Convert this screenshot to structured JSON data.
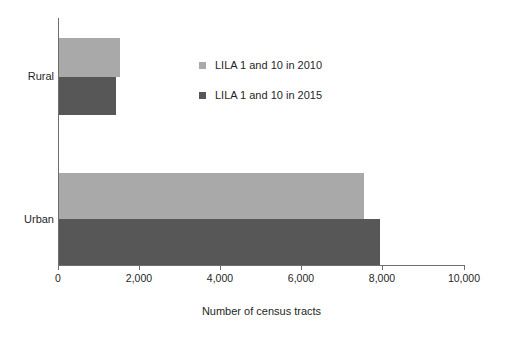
{
  "chart_data": {
    "type": "bar",
    "orientation": "horizontal",
    "title": "",
    "xlabel": "Number of census tracts",
    "ylabel": "",
    "categories": [
      "Rural",
      "Urban"
    ],
    "series": [
      {
        "name": "LILA 1 and 10 in 2010",
        "color": "#a9a9a9",
        "values": [
          1500,
          7500
        ]
      },
      {
        "name": "LILA 1 and 10 in 2015",
        "color": "#575757",
        "values": [
          1400,
          7900
        ]
      }
    ],
    "xlim": [
      0,
      10000
    ],
    "xticks": [
      0,
      2000,
      4000,
      6000,
      8000,
      10000
    ],
    "xtick_labels": [
      "0",
      "2,000",
      "4,000",
      "6,000",
      "8,000",
      "10,000"
    ],
    "grid": false,
    "legend_position": "inside-upper-center"
  },
  "legend": {
    "items": [
      {
        "label": "LILA 1 and 10 in 2010",
        "color": "#a9a9a9"
      },
      {
        "label": "LILA 1 and 10 in 2015",
        "color": "#575757"
      }
    ]
  },
  "axis": {
    "x_title": "Number of census tracts",
    "tick_labels": [
      "0",
      "2,000",
      "4,000",
      "6,000",
      "8,000",
      "10,000"
    ],
    "category_labels": [
      "Rural",
      "Urban"
    ]
  },
  "colors": {
    "series_2010": "#a9a9a9",
    "series_2015": "#575757",
    "axis": "#6e6e6e",
    "text": "#1f1f1f",
    "background": "#ffffff"
  }
}
